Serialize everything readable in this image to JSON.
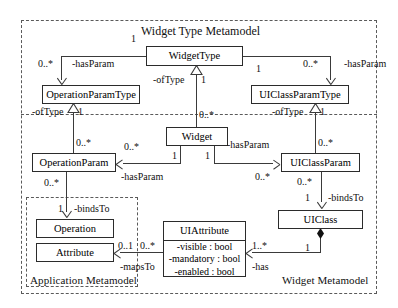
{
  "diagram": {
    "type": "uml-class-diagram",
    "title": "Widget Type Metamodel"
  },
  "packages": [
    {
      "id": "widget-type-metamodel",
      "label": "Widget Type Metamodel"
    },
    {
      "id": "application-metamodel",
      "label": "Application Metamodel"
    },
    {
      "id": "widget-metamodel",
      "label": "Widget Metamodel"
    }
  ],
  "classes": [
    {
      "id": "widgettype",
      "name": "WidgetType",
      "attributes": []
    },
    {
      "id": "operationparamtype",
      "name": "OperationParamType",
      "attributes": []
    },
    {
      "id": "uiclassparamtype",
      "name": "UIClassParamType",
      "attributes": []
    },
    {
      "id": "widget",
      "name": "Widget",
      "attributes": []
    },
    {
      "id": "operationparam",
      "name": "OperationParam",
      "attributes": []
    },
    {
      "id": "uiclassparam",
      "name": "UIClassParam",
      "attributes": []
    },
    {
      "id": "operation",
      "name": "Operation",
      "attributes": []
    },
    {
      "id": "attribute",
      "name": "Attribute",
      "attributes": []
    },
    {
      "id": "uiattribute",
      "name": "UIAttribute",
      "attributes": [
        "-visible : bool",
        "-mandatory : bool",
        "-enabled : bool"
      ]
    },
    {
      "id": "uiclass",
      "name": "UIClass",
      "attributes": []
    }
  ],
  "labels": {
    "has_param": "-hasParam",
    "of_type": "-ofType",
    "binds_to": "-bindsTo",
    "maps_to": "-mapsTo",
    "has": "-has"
  },
  "multiplicities": {
    "one": "1",
    "zero_many": "0..*",
    "zero_one": "0..1",
    "one_many": "1..*"
  },
  "relationships": [
    {
      "from": "widgettype",
      "to": "operationparamtype",
      "label": "-hasParam",
      "source_mult": "1",
      "target_mult": "0..*"
    },
    {
      "from": "widgettype",
      "to": "uiclassparamtype",
      "label": "-hasParam",
      "source_mult": "1",
      "target_mult": "0..*"
    },
    {
      "from": "widget",
      "to": "widgettype",
      "label": "-ofType",
      "source_mult": "0..*",
      "target_mult": "1"
    },
    {
      "from": "operationparam",
      "to": "operationparamtype",
      "label": "-ofType",
      "source_mult": "0..*",
      "target_mult": "1"
    },
    {
      "from": "uiclassparam",
      "to": "uiclassparamtype",
      "label": "-ofType",
      "source_mult": "0..*",
      "target_mult": "1"
    },
    {
      "from": "widget",
      "to": "operationparam",
      "label": "-hasParam",
      "source_mult": "1",
      "target_mult": "0..*"
    },
    {
      "from": "widget",
      "to": "uiclassparam",
      "label": "-hasParam",
      "source_mult": "1",
      "target_mult": "0..*"
    },
    {
      "from": "operationparam",
      "to": "operation",
      "label": "-bindsTo",
      "source_mult": "0..*",
      "target_mult": "1"
    },
    {
      "from": "uiclassparam",
      "to": "uiclass",
      "label": "-bindsTo",
      "source_mult": "0..*",
      "target_mult": "1"
    },
    {
      "from": "uiattribute",
      "to": "attribute",
      "label": "-mapsTo",
      "source_mult": "0..*",
      "target_mult": "0..1"
    },
    {
      "from": "uiclass",
      "to": "uiattribute",
      "label": "-has",
      "source_mult": "1",
      "target_mult": "1..*"
    }
  ],
  "colors": {
    "box_border": "#2b2b2b",
    "package_border": "#5a5a5a",
    "line": "#3a3a3a",
    "background": "#ffffff",
    "text": "#111111"
  }
}
